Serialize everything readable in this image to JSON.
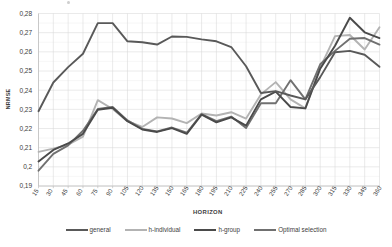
{
  "chart_data": {
    "type": "line",
    "title": "",
    "xlabel": "HORIZON",
    "ylabel": "NRMSE",
    "xlim": [
      15,
      360
    ],
    "ylim": [
      0.19,
      0.28
    ],
    "grid": true,
    "legend_position": "bottom",
    "y_tick_labels": [
      "0,28",
      "0,27",
      "0,26",
      "0,25",
      "0,24",
      "0,23",
      "0,22",
      "0,21",
      "0,2",
      "0,19"
    ],
    "y_tick_values": [
      0.28,
      0.27,
      0.26,
      0.25,
      0.24,
      0.23,
      0.22,
      0.21,
      0.2,
      0.19
    ],
    "categories": [
      15,
      30,
      45,
      60,
      75,
      90,
      105,
      120,
      135,
      150,
      165,
      180,
      195,
      210,
      225,
      240,
      255,
      270,
      285,
      300,
      315,
      330,
      345,
      360
    ],
    "x_tick_labels": [
      "15",
      "30",
      "45",
      "60",
      "75",
      "90",
      "105",
      "120",
      "135",
      "150",
      "165",
      "180",
      "195",
      "210",
      "225",
      "240",
      "255",
      "270",
      "285",
      "300",
      "315",
      "330",
      "345",
      "360"
    ],
    "series": [
      {
        "name": "general",
        "color": "#595959",
        "width": 1.9,
        "values": [
          0.229,
          0.244,
          0.252,
          0.259,
          0.275,
          0.275,
          0.2655,
          0.265,
          0.2638,
          0.268,
          0.2678,
          0.2665,
          0.2655,
          0.2625,
          0.2525,
          0.2385,
          0.2395,
          0.2372,
          0.2352,
          0.2468,
          0.2598,
          0.2605,
          0.2585,
          0.2522
        ]
      },
      {
        "name": "h-individual",
        "color": "#b3b3b3",
        "width": 1.9,
        "values": [
          0.2078,
          0.2095,
          0.2115,
          0.2158,
          0.2348,
          0.2302,
          0.2238,
          0.2208,
          0.2258,
          0.2252,
          0.2228,
          0.2278,
          0.2268,
          0.2285,
          0.2252,
          0.2378,
          0.2442,
          0.2352,
          0.2305,
          0.2518,
          0.2682,
          0.2688,
          0.2612,
          0.2728
        ]
      },
      {
        "name": "h-group",
        "color": "#4a4a4a",
        "width": 1.9,
        "values": [
          0.2028,
          0.2088,
          0.2122,
          0.2172,
          0.2298,
          0.2308,
          0.2238,
          0.2195,
          0.2182,
          0.2202,
          0.2172,
          0.2272,
          0.2232,
          0.2258,
          0.2215,
          0.2352,
          0.2392,
          0.2312,
          0.2305,
          0.2512,
          0.2632,
          0.2778,
          0.2702,
          0.2672
        ]
      },
      {
        "name": "Optimal selection",
        "color": "#707070",
        "width": 1.9,
        "values": [
          0.198,
          0.2068,
          0.2112,
          0.2188,
          0.2302,
          0.2312,
          0.2242,
          0.2198,
          0.2185,
          0.2205,
          0.2178,
          0.2275,
          0.2238,
          0.2262,
          0.2202,
          0.2332,
          0.2332,
          0.2452,
          0.2352,
          0.2535,
          0.2605,
          0.2668,
          0.2672,
          0.2638
        ]
      }
    ],
    "legend_entries": [
      {
        "label": "general",
        "color": "#595959"
      },
      {
        "label": "h-individual",
        "color": "#b3b3b3"
      },
      {
        "label": "h-group",
        "color": "#4a4a4a"
      },
      {
        "label": "Optimal selection",
        "color": "#707070"
      }
    ],
    "grid_color": "#d9d9d9",
    "axis_color": "#bfbfbf",
    "background": "#ffffff"
  }
}
